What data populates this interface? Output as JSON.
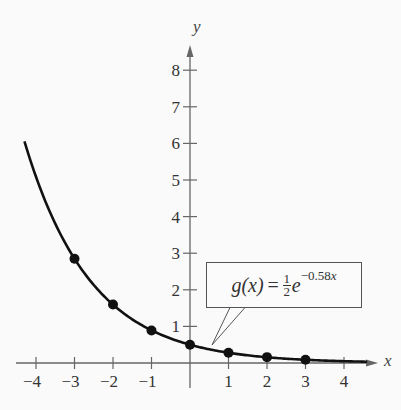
{
  "chart_data": {
    "type": "line",
    "title": "",
    "function_label": {
      "name": "g(x)",
      "equals": "=",
      "coef_num": "1",
      "coef_den": "2",
      "base": "e",
      "exponent": "−0.58",
      "exponent_var": "x",
      "plain": "g(x) = (1/2)e^(−0.58x)"
    },
    "xlabel": "x",
    "ylabel": "y",
    "xlim": [
      -4.4,
      4.9
    ],
    "ylim": [
      0,
      8.6
    ],
    "grid": false,
    "x_ticks": [
      -4,
      -3,
      -2,
      -1,
      1,
      2,
      3,
      4
    ],
    "x_tick_labels": [
      "−4",
      "−3",
      "−2",
      "−1",
      "1",
      "2",
      "3",
      "4"
    ],
    "y_ticks": [
      1,
      2,
      3,
      4,
      5,
      6,
      7,
      8
    ],
    "y_tick_labels": [
      "1",
      "2",
      "3",
      "4",
      "5",
      "6",
      "7",
      "8"
    ],
    "series": [
      {
        "name": "g(x) = 1/2 e^(−0.58x)",
        "kind": "curve",
        "x_range": [
          -4.3,
          4.6
        ],
        "formula": {
          "a": 0.5,
          "k": -0.58
        }
      },
      {
        "name": "plotted points",
        "kind": "points",
        "x": [
          -3,
          -2,
          -1,
          0,
          1,
          2,
          3
        ],
        "values": [
          2.85,
          1.6,
          0.89,
          0.5,
          0.28,
          0.16,
          0.09
        ]
      }
    ]
  },
  "colors": {
    "curve": "#111111",
    "axis": "#666666",
    "background": "#fafafa"
  }
}
